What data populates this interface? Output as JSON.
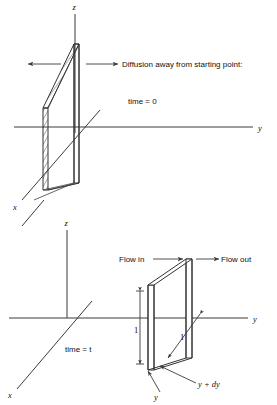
{
  "figure": {
    "background_color": "#ffffff",
    "line_color": "#333333"
  },
  "panels": [
    {
      "id": "top-panel",
      "caption": "Diffusion away from starting point:",
      "time_label": "time = 0",
      "axes": {
        "z_label": "z",
        "y_label": "y",
        "x_label": "x"
      },
      "arrows": {
        "left_arrow_name": "spread-left-arrow",
        "right_arrow_name": "spread-right-arrow"
      },
      "slab_name": "hatched-slab"
    },
    {
      "id": "bottom-panel",
      "time_label": "time = t",
      "axes": {
        "z_label": "z",
        "y_label": "y",
        "x_label": "x"
      },
      "flow_in_label": "Flow in",
      "flow_out_label": "Flow out",
      "dimension_height": "1",
      "dimension_depth": "1",
      "position_near_label": "y",
      "position_far_label": "y + dy",
      "box_name": "control-volume-box"
    }
  ],
  "colors": {
    "stroke": "#333333",
    "axis": "#3a3a3a",
    "text": "#111111",
    "background": "#ffffff"
  }
}
